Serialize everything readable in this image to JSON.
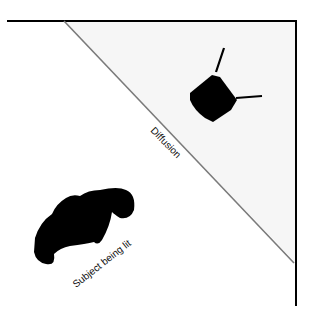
{
  "diagram": {
    "labels": {
      "diffusion": "Diffusion",
      "subject": "Subject being lit"
    },
    "elements": {
      "walls": "room-corner",
      "diffusion_panel": "diagonal diffusion panel",
      "light": "light-on-stand-icon",
      "subject": "person-top-view-icon"
    },
    "colors": {
      "wall": "#000000",
      "diffusion": "#7a7a7a",
      "lit_area": "#f6f6f6",
      "light": "#000000",
      "subject": "#000000",
      "background": "#ffffff"
    }
  }
}
